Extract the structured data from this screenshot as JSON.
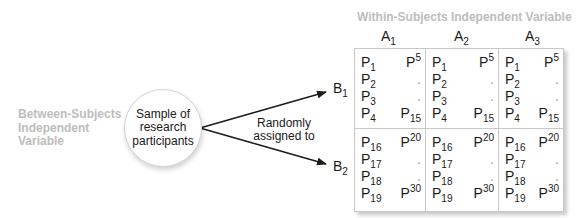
{
  "between_label": {
    "line1": "Between-Subjects",
    "line2": "Independent",
    "line3": "Variable"
  },
  "within_label": "Within-Subjects Independent Variable",
  "sample": {
    "line1": "Sample of",
    "line2": "research",
    "line3": "participants"
  },
  "assignment": {
    "line1": "Randomly",
    "line2": "assigned to"
  },
  "b_levels": [
    {
      "base": "B",
      "sub": "1"
    },
    {
      "base": "B",
      "sub": "2"
    }
  ],
  "a_levels": [
    {
      "base": "A",
      "sub": "1"
    },
    {
      "base": "A",
      "sub": "2"
    },
    {
      "base": "A",
      "sub": "3"
    }
  ],
  "colors": {
    "gray_label": "#bdbdbd",
    "grid_border": "#c8c8c8",
    "arrow": "#1a1a1a"
  },
  "cells": {
    "row1": {
      "left": [
        {
          "base": "P",
          "sub": "1"
        },
        {
          "base": "P",
          "sub": "2"
        },
        {
          "base": "P",
          "sub": "3"
        },
        {
          "base": "P",
          "sub": "4"
        }
      ],
      "right": [
        {
          "base": "P",
          "sub": "5",
          "pos": "sup"
        },
        {
          "dot": "."
        },
        {
          "dot": "."
        },
        {
          "base": "P",
          "sub": "15"
        }
      ]
    },
    "row2": {
      "left": [
        {
          "base": "P",
          "sub": "16"
        },
        {
          "base": "P",
          "sub": "17"
        },
        {
          "base": "P",
          "sub": "18"
        },
        {
          "base": "P",
          "sub": "19"
        }
      ],
      "right": [
        {
          "base": "P",
          "sub": "20",
          "pos": "sup"
        },
        {
          "dot": "."
        },
        {
          "dot": "."
        },
        {
          "base": "P",
          "sub": "30",
          "pos": "sup"
        }
      ]
    }
  }
}
